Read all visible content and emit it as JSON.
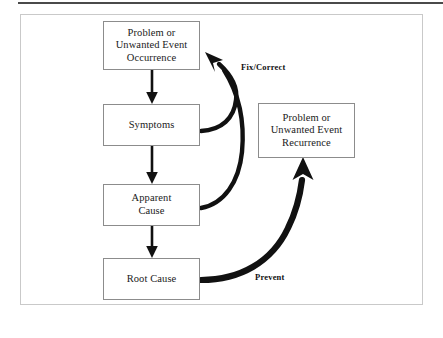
{
  "figure": {
    "background_color": "#ffffff",
    "frame_color": "#c9c9c9",
    "rule_color": "#4a4a4a",
    "box_border_color": "#8c8c8c",
    "arrow_color": "#111111"
  },
  "nodes": [
    {
      "id": "problem-occurrence",
      "label": "Problem or\nUnwanted Event\nOccurrence",
      "lines": [
        "Problem or",
        "Unwanted Event",
        "Occurrence"
      ]
    },
    {
      "id": "symptoms",
      "label": "Symptoms",
      "lines": [
        "Symptoms"
      ]
    },
    {
      "id": "apparent-cause",
      "label": "Apparent\nCause",
      "lines": [
        "Apparent",
        "Cause"
      ]
    },
    {
      "id": "root-cause",
      "label": "Root Cause",
      "lines": [
        "Root Cause"
      ]
    },
    {
      "id": "problem-recurrence",
      "label": "Problem or\nUnwanted Event\nRecurrence",
      "lines": [
        "Problem or",
        "Unwanted Event",
        "Recurrence"
      ]
    }
  ],
  "edges": [
    {
      "id": "occurrence-to-symptoms",
      "from": "problem-occurrence",
      "to": "symptoms",
      "label": "",
      "style": "straight-down"
    },
    {
      "id": "symptoms-to-apparent-cause",
      "from": "symptoms",
      "to": "apparent-cause",
      "label": "",
      "style": "straight-down"
    },
    {
      "id": "apparent-cause-to-root-cause",
      "from": "apparent-cause",
      "to": "root-cause",
      "label": "",
      "style": "straight-down"
    },
    {
      "id": "symptoms-fix-correct",
      "from": "symptoms",
      "to": "problem-occurrence",
      "label": "Fix/Correct",
      "style": "curved-up-left"
    },
    {
      "id": "apparent-cause-fix-correct",
      "from": "apparent-cause",
      "to": "problem-occurrence",
      "label": "Fix/Correct",
      "style": "curved-up-left"
    },
    {
      "id": "root-cause-prevent",
      "from": "root-cause",
      "to": "problem-recurrence",
      "label": "Prevent",
      "style": "curved-up-right"
    }
  ],
  "edge_labels": {
    "fix_correct": "Fix/Correct",
    "prevent": "Prevent"
  }
}
